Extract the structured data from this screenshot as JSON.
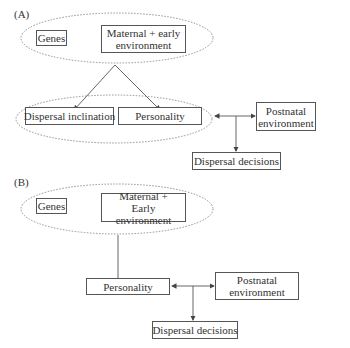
{
  "panel_a": {
    "label": "(A)",
    "genes": "Genes",
    "maternal": "Maternal + early environment",
    "dispersal_inclination": "Dispersal inclination",
    "personality": "Personality",
    "postnatal": "Postnatal environment",
    "dispersal_decisions": "Dispersal decisions"
  },
  "panel_b": {
    "label": "(B)",
    "genes": "Genes",
    "maternal": "Maternal + Early environment",
    "personality": "Personality",
    "postnatal": "Postnatal environment",
    "dispersal_decisions": "Dispersal decisions"
  },
  "colors": {
    "line": "#555555",
    "text": "#333333",
    "background": "#ffffff"
  }
}
